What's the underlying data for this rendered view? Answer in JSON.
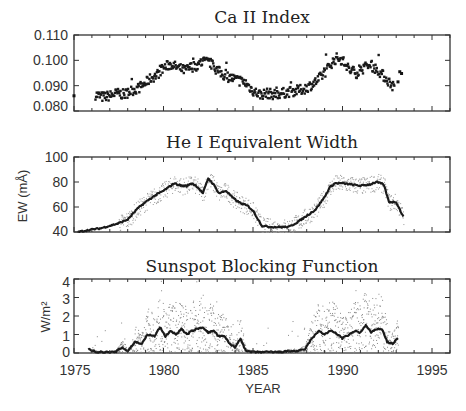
{
  "chart_data": [
    {
      "type": "scatter",
      "title": "Ca II Index",
      "xlabel": "",
      "ylabel": "",
      "xlim": [
        1975,
        1996
      ],
      "ylim": [
        0.08,
        0.11
      ],
      "yticks": [
        "0.110",
        "0.100",
        "0.090",
        "0.080"
      ],
      "grid": false,
      "series": [
        {
          "name": "Ca II Index (daily)",
          "x": [
            1975.0,
            1976.2,
            1976.6,
            1977.0,
            1977.4,
            1977.8,
            1978.2,
            1978.6,
            1979.0,
            1979.3,
            1979.6,
            1980.0,
            1980.4,
            1980.8,
            1981.2,
            1981.6,
            1981.9,
            1982.2,
            1982.6,
            1983.0,
            1983.4,
            1983.8,
            1984.2,
            1984.6,
            1985.0,
            1985.4,
            1985.8,
            1986.2,
            1986.6,
            1987.0,
            1987.4,
            1987.8,
            1988.2,
            1988.6,
            1989.0,
            1989.4,
            1989.7,
            1990.0,
            1990.4,
            1990.8,
            1991.2,
            1991.6,
            1992.0,
            1992.4,
            1992.8,
            1993.3
          ],
          "y": [
            0.086,
            0.0865,
            0.0855,
            0.086,
            0.087,
            0.0865,
            0.088,
            0.089,
            0.091,
            0.093,
            0.094,
            0.097,
            0.0985,
            0.097,
            0.096,
            0.0975,
            0.098,
            0.0995,
            0.099,
            0.096,
            0.094,
            0.093,
            0.092,
            0.091,
            0.088,
            0.0865,
            0.087,
            0.0865,
            0.087,
            0.0875,
            0.088,
            0.0885,
            0.09,
            0.092,
            0.095,
            0.099,
            0.101,
            0.1,
            0.096,
            0.095,
            0.097,
            0.098,
            0.096,
            0.093,
            0.09,
            0.095
          ]
        }
      ]
    },
    {
      "type": "line",
      "title": "He I Equivalent Width",
      "xlabel": "",
      "ylabel": "EW (mÅ)",
      "xlim": [
        1975,
        1996
      ],
      "ylim": [
        40,
        100
      ],
      "yticks": [
        "100",
        "80",
        "60",
        "40"
      ],
      "grid": false,
      "series": [
        {
          "name": "He I EW (smoothed)",
          "x": [
            1975.2,
            1976.0,
            1976.5,
            1977.0,
            1977.5,
            1978.0,
            1978.5,
            1979.0,
            1979.5,
            1980.0,
            1980.3,
            1980.6,
            1981.0,
            1981.3,
            1981.6,
            1981.9,
            1982.2,
            1982.5,
            1982.8,
            1983.1,
            1983.5,
            1983.9,
            1984.3,
            1984.7,
            1985.0,
            1985.5,
            1986.0,
            1986.5,
            1987.0,
            1987.5,
            1988.0,
            1988.5,
            1989.0,
            1989.3,
            1989.6,
            1990.0,
            1990.5,
            1991.0,
            1991.5,
            1991.9,
            1992.3,
            1992.6,
            1993.0,
            1993.4
          ],
          "y": [
            40,
            42,
            43,
            45,
            47,
            50,
            58,
            64,
            69,
            73,
            76,
            79,
            77,
            77,
            79,
            76,
            71,
            83,
            78,
            71,
            73,
            67,
            63,
            61,
            57,
            45,
            44,
            44,
            44,
            48,
            53,
            58,
            68,
            76,
            79,
            79,
            78,
            77,
            78,
            80,
            78,
            64,
            64,
            52
          ]
        }
      ]
    },
    {
      "type": "line",
      "title": "Sunspot Blocking Function",
      "xlabel": "YEAR",
      "ylabel": "W/m²",
      "xlim": [
        1975,
        1996
      ],
      "ylim": [
        0,
        4
      ],
      "xticks": [
        "1975",
        "1980",
        "1985",
        "1990",
        "1995"
      ],
      "yticks": [
        "4",
        "3",
        "2",
        "1",
        "0"
      ],
      "grid": false,
      "series": [
        {
          "name": "Sunspot blocking (smoothed)",
          "x": [
            1975.8,
            1976.3,
            1976.8,
            1977.3,
            1977.7,
            1978.0,
            1978.4,
            1978.8,
            1979.1,
            1979.5,
            1979.8,
            1980.1,
            1980.4,
            1980.7,
            1981.0,
            1981.3,
            1981.6,
            1981.9,
            1982.2,
            1982.5,
            1982.8,
            1983.1,
            1983.4,
            1983.7,
            1984.0,
            1984.3,
            1984.6,
            1985.0,
            1985.5,
            1986.0,
            1986.5,
            1987.0,
            1987.5,
            1987.9,
            1988.3,
            1988.7,
            1989.0,
            1989.3,
            1989.6,
            1990.0,
            1990.4,
            1990.7,
            1991.0,
            1991.3,
            1991.6,
            1991.9,
            1992.2,
            1992.5,
            1992.8,
            1993.1
          ],
          "y": [
            0.2,
            0.05,
            0.05,
            0.05,
            0.3,
            0.1,
            0.6,
            0.5,
            1.0,
            0.9,
            1.4,
            0.9,
            1.2,
            1.0,
            1.3,
            1.0,
            1.2,
            1.3,
            1.4,
            1.1,
            1.2,
            0.9,
            0.9,
            0.5,
            0.3,
            0.8,
            0.1,
            0.05,
            0.05,
            0.05,
            0.05,
            0.1,
            0.1,
            0.2,
            0.8,
            1.2,
            1.0,
            1.2,
            1.1,
            0.8,
            1.0,
            1.2,
            1.1,
            1.5,
            1.1,
            1.3,
            1.3,
            0.6,
            0.5,
            0.8
          ]
        }
      ]
    }
  ]
}
